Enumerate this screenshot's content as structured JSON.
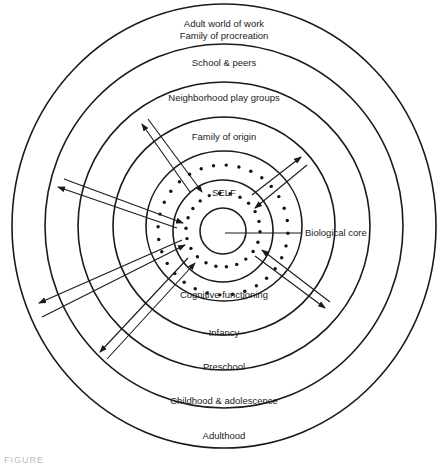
{
  "diagram": {
    "center_outer": [
      224,
      226
    ],
    "center_inner": [
      223,
      231
    ],
    "rings": [
      {
        "name": "adulthood-ring",
        "rx": 212,
        "ry": 222
      },
      {
        "name": "childhood-ring",
        "rx": 179,
        "ry": 182
      },
      {
        "name": "preschool-ring",
        "rx": 146,
        "ry": 144
      },
      {
        "name": "infancy-ring",
        "rx": 111,
        "ry": 109
      },
      {
        "name": "cognitive-ring",
        "rx": 78,
        "ry": 75
      }
    ],
    "inner_rings": [
      {
        "name": "self-ring",
        "rx": 50,
        "ry": 51
      },
      {
        "name": "biological-core-ring",
        "rx": 23,
        "ry": 23
      }
    ],
    "dot_rings": [
      {
        "name": "outer-dot-ring",
        "r": 65,
        "count": 32
      },
      {
        "name": "inner-dot-ring",
        "r": 37,
        "count": 22
      }
    ],
    "upper_labels": {
      "adult_world": "Adult world of work",
      "family_procreation": "Family of procreation",
      "school_peers": "School & peers",
      "neighborhood": "Neighborhood play groups",
      "family_origin": "Family of origin",
      "self": "SELF"
    },
    "core_label": "Biological core",
    "lower_labels": {
      "cognitive": "Cognitive functioning",
      "infancy": "Infancy",
      "preschool": "Preschool",
      "childhood": "Childhood & adolescence",
      "adulthood": "Adulthood"
    },
    "arrows": [
      {
        "name": "upper-left-out-arrow",
        "from": [
          190,
          192
        ],
        "to": [
          142,
          124
        ]
      },
      {
        "name": "upper-left-in-arrow",
        "from": [
          148,
          119
        ],
        "to": [
          202,
          192
        ]
      },
      {
        "name": "upper-right-out-arrow",
        "from": [
          252,
          195
        ],
        "to": [
          301,
          157
        ]
      },
      {
        "name": "upper-right-in-arrow",
        "from": [
          307,
          165
        ],
        "to": [
          255,
          208
        ]
      },
      {
        "name": "lower-right-out-arrow",
        "from": [
          255,
          256
        ],
        "to": [
          325,
          308
        ]
      },
      {
        "name": "lower-right-in-arrow",
        "from": [
          330,
          302
        ],
        "to": [
          262,
          250
        ]
      },
      {
        "name": "left-upper-out-arrow",
        "from": [
          177,
          228
        ],
        "to": [
          58,
          187
        ]
      },
      {
        "name": "left-upper-in-arrow",
        "from": [
          64,
          179
        ],
        "to": [
          183,
          223
        ]
      },
      {
        "name": "left-lower-out-arrow",
        "from": [
          182,
          240
        ],
        "to": [
          39,
          303
        ]
      },
      {
        "name": "left-lower-in-arrow",
        "from": [
          42,
          317
        ],
        "to": [
          185,
          245
        ]
      },
      {
        "name": "lower-left-out-arrow",
        "from": [
          188,
          258
        ],
        "to": [
          100,
          352
        ]
      },
      {
        "name": "lower-left-in-arrow",
        "from": [
          107,
          359
        ],
        "to": [
          195,
          263
        ]
      }
    ],
    "core_pointer": {
      "from": [
        225,
        233
      ],
      "to": [
        302,
        233
      ]
    }
  },
  "caption": "FIGURE"
}
